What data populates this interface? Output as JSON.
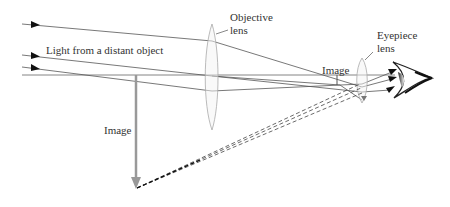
{
  "diagram": {
    "labels": {
      "light_source": "Light from a distant object",
      "objective_lens_line1": "Objective",
      "objective_lens_line2": "lens",
      "eyepiece_lens_line1": "Eyepiece",
      "eyepiece_lens_line2": "lens",
      "real_image": "Image",
      "virtual_image": "Image"
    },
    "colors": {
      "ray": "#555555",
      "lens": "#aaaaaa",
      "virtual_image_arrow": "#999999",
      "dashed_ray": "#444444",
      "text": "#333333"
    }
  }
}
